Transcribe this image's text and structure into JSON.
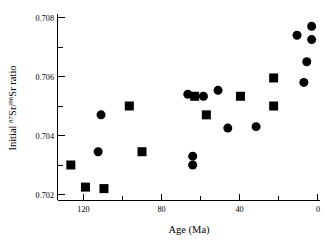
{
  "figure": {
    "background_color": "#ffffff",
    "foreground_color": "#000000"
  },
  "axes": {
    "x": {
      "title": "Age (Ma)",
      "tick_labels": [
        "120",
        "80",
        "40",
        "0"
      ],
      "tick_values": [
        120,
        80,
        40,
        0
      ],
      "minor_tick_values": [
        140,
        100,
        60,
        20
      ],
      "range": [
        140,
        -4
      ],
      "inverted": true,
      "unit": "Ma"
    },
    "y": {
      "title_plain": "Initial 87Sr/86Sr ratio",
      "title_prefix": "Initial ",
      "title_sup1": "87",
      "title_mid1": "Sr/",
      "title_sup2": "86",
      "title_suffix": "Sr ratio",
      "tick_labels": [
        "0.708",
        "0.706",
        "0.704",
        "0.702"
      ],
      "tick_values": [
        0.708,
        0.706,
        0.704,
        0.702
      ],
      "minor_tick_values": [
        0.707,
        0.705,
        0.703
      ],
      "range": [
        0.7016,
        0.7082
      ]
    }
  },
  "chart_data": {
    "type": "scatter",
    "title": "",
    "xlabel": "Age (Ma)",
    "ylabel": "Initial 87Sr/86Sr ratio",
    "xlim": [
      140,
      -4
    ],
    "ylim": [
      0.7016,
      0.7082
    ],
    "grid": false,
    "legend": "none",
    "x_inverted": true,
    "series": [
      {
        "name": "circles",
        "marker": "circle",
        "color": "#000000",
        "marker_size_px": 9,
        "points": [
          {
            "x": 112.5,
            "y": 0.70345
          },
          {
            "x": 111.0,
            "y": 0.7047
          },
          {
            "x": 66.5,
            "y": 0.7054
          },
          {
            "x": 64.0,
            "y": 0.7033
          },
          {
            "x": 64.0,
            "y": 0.703
          },
          {
            "x": 58.5,
            "y": 0.70533
          },
          {
            "x": 46.0,
            "y": 0.70425
          },
          {
            "x": 51.0,
            "y": 0.70553
          },
          {
            "x": 31.5,
            "y": 0.7043
          },
          {
            "x": 10.5,
            "y": 0.7074
          },
          {
            "x": 3.0,
            "y": 0.7077
          },
          {
            "x": 3.0,
            "y": 0.70725
          },
          {
            "x": 5.5,
            "y": 0.7065
          },
          {
            "x": 7.0,
            "y": 0.7058
          }
        ]
      },
      {
        "name": "squares",
        "marker": "square",
        "color": "#000000",
        "marker_size_px": 9,
        "points": [
          {
            "x": 126.5,
            "y": 0.703
          },
          {
            "x": 119.0,
            "y": 0.70225
          },
          {
            "x": 109.5,
            "y": 0.7022
          },
          {
            "x": 96.5,
            "y": 0.705
          },
          {
            "x": 90.0,
            "y": 0.70345
          },
          {
            "x": 63.0,
            "y": 0.70533
          },
          {
            "x": 57.0,
            "y": 0.7047
          },
          {
            "x": 39.5,
            "y": 0.70533
          },
          {
            "x": 22.5,
            "y": 0.70595
          },
          {
            "x": 22.5,
            "y": 0.705
          }
        ]
      }
    ]
  }
}
